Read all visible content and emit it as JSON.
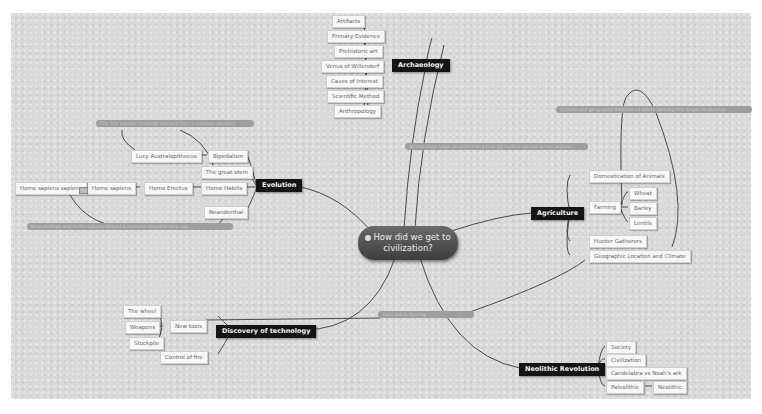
{
  "central_topic": {
    "label_line1": "How did we get to",
    "label_line2": "civilization?",
    "icon": "globe-icon"
  },
  "branches": {
    "archaeology": {
      "label": "Archaeology",
      "children": [
        "Artifacts",
        "Primary Evidence",
        "Prehistoric art",
        "Venus of Willendorf",
        "Caves of Interest",
        "Scientific Method",
        "Anthropology"
      ]
    },
    "evolution": {
      "label": "Evolution",
      "children": [
        "Bipedalism",
        "The great stem",
        "Homo Habilis",
        "Neanderthal"
      ],
      "sub": {
        "bipedalism": "Lucy Australopithecus",
        "habilis_chain": [
          "Homo Erectus",
          "Homo sapiens",
          "Homo sapiens sapiens"
        ]
      }
    },
    "agriculture": {
      "label": "Agriculture",
      "children": [
        "Domestication of Animals",
        "Farming",
        "Hunter Gatherers",
        "Geographic Location and Climate"
      ],
      "farming_children": [
        "Wheat",
        "Barley",
        "Lentils"
      ]
    },
    "technology": {
      "label": "Discovery of technology",
      "children": [
        "New tools",
        "Control of fire"
      ],
      "tools_children": [
        "The wheel",
        "Weapons",
        "Stockpile"
      ]
    },
    "neolithic": {
      "label": "Neolithic Revolution",
      "children": [
        "Society",
        "Civilization",
        "Candelabra vs Noah's ark",
        "Paleolithic"
      ],
      "paleolithic_child": "Neolithic"
    }
  },
  "relationships": {
    "evolution_top": "The first bipedal hominids evolved from a common ancestor",
    "evolution_bottom": "Neanderthals and Homo sapiens shared a common ancestor long ago",
    "archaeology_agri": "Archaeology helps us understand how agriculture spread across regions",
    "agri_top": "Climate and geography determined where farming first began to develop",
    "tech": "Tools led to farming"
  },
  "colors": {
    "canvas": "#d9d9d9",
    "main_topic": "#141414",
    "node_bg": "#f7f7f7",
    "relationship": "#9e9e9e",
    "line": "#4a4a4a"
  }
}
